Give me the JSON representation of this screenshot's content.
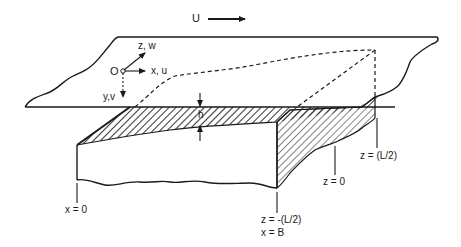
{
  "figure": {
    "type": "schematic"
  },
  "labels": {
    "flow_velocity": "U",
    "origin": "O",
    "x_axis": "x, u",
    "y_axis": "y,v",
    "z_axis": "z, w",
    "gap_height": "h",
    "x_start": "x = 0",
    "z_left": "z = -(L/2)",
    "x_end": "x = B",
    "z_center": "z = 0",
    "z_right": "z = (L/2)"
  },
  "colors": {
    "line": "#1a1a1a",
    "background": "#ffffff"
  }
}
